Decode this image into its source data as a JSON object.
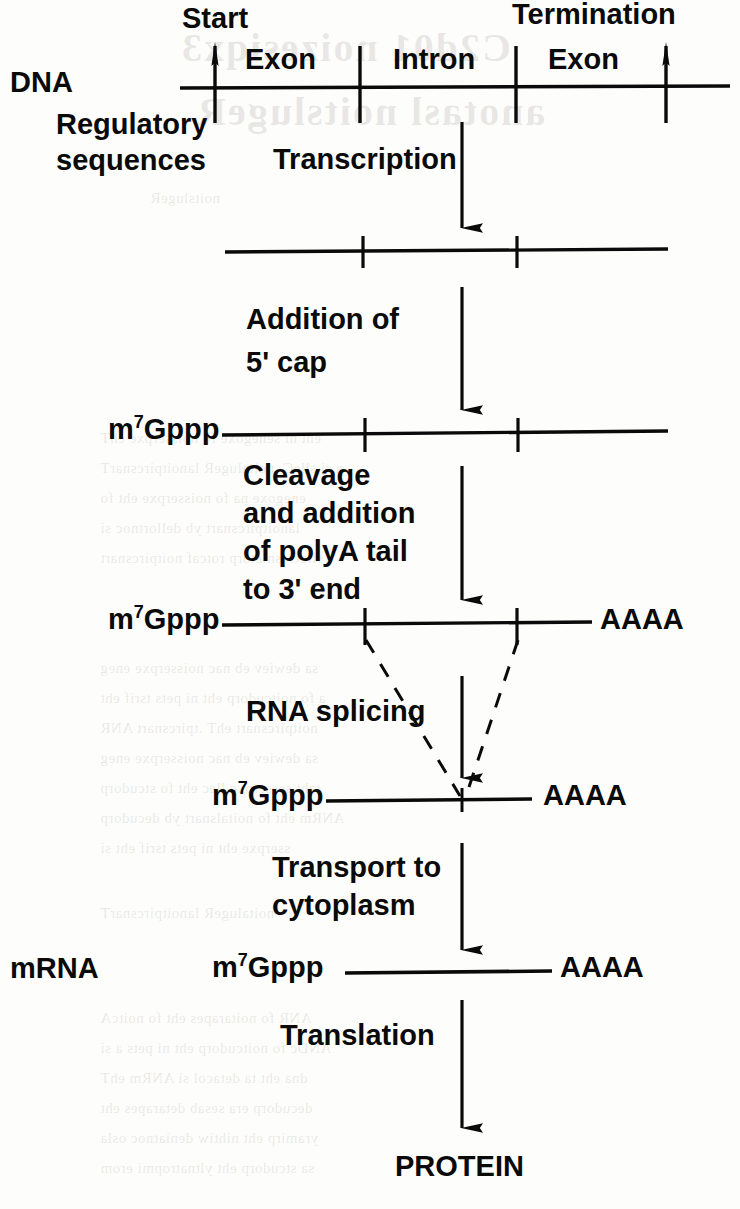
{
  "diagram": {
    "ink_color": "#0a0a0a",
    "background_color": "#fdfdfb",
    "row_labels": {
      "dna": "DNA",
      "regulatory_line1": "Regulatory",
      "regulatory_line2": "sequences",
      "mrna": "mRNA"
    },
    "gene_map": {
      "start_label": "Start",
      "termination_label": "Termination",
      "segments": [
        "Exon",
        "Intron",
        "Exon"
      ]
    },
    "steps": [
      {
        "id": "transcription",
        "lines": [
          "Transcription"
        ]
      },
      {
        "id": "capping",
        "lines": [
          "Addition of",
          "5' cap"
        ]
      },
      {
        "id": "cleavage-polya",
        "lines": [
          "Cleavage",
          "and addition",
          "of polyA tail",
          "to 3' end"
        ]
      },
      {
        "id": "splicing",
        "lines": [
          "RNA splicing"
        ]
      },
      {
        "id": "transport",
        "lines": [
          "Transport to",
          "cytoplasm"
        ]
      },
      {
        "id": "translation",
        "lines": [
          "Translation"
        ]
      }
    ],
    "cap_label": "m7Gppp",
    "cap_label_base": "m",
    "cap_label_sup": "7",
    "cap_label_rest": "Gppp",
    "polya_label": "AAAA",
    "product_label": "PROTEIN"
  },
  "ghost_text": {
    "title_line1": "C2d01 noizesiqx3",
    "title_line2": "anotasl noitslugeR",
    "lines": [
      "noitslugeR",
      "eht ni senegoxe fo noisserpxe ehT",
      "a si slleC .noitalugeR lanoitpircsnarT",
      "enegoxe na fo noisserpxe eht fo",
      "lanoitpircsnart yb dellortnoc si",
      "slleC .snietorp rotcaf noitpircsnart",
      "sa dewiev eb nac noisserpxe eneg",
      "a fo noitcudorp eht ni pets tsrif eht",
      "noitpircsnart ehT .tpircsnart ANR",
      "sa dewiev eb nac noisserpxe eneg",
      "taht sesserpxe llec eht fo stcudorp",
      "ANRm eht fo noitalsnart yb decudorp",
      "sserpxe eht ni pets tsrif eht si",
      "noitalugeR lanoitpircsnarT",
      "ANR fo noitarapes eht fo noitcA",
      "ANDc fo noitcudorp eht ni pets a si",
      "dna eht ta detacol si ANRm ehT",
      "decudorp era sesab detarapes eht",
      "yramirp eht nihtiw deniatnoc osla",
      "sa stcudorp eht yltnatropmi erom"
    ]
  },
  "layout": {
    "dna_line": {
      "x1": 180,
      "x2": 730,
      "y": 88,
      "ticks": [
        215,
        360,
        516,
        666
      ]
    },
    "transcript_line": {
      "x1": 225,
      "x2": 668,
      "y": 251,
      "ticks": [
        363,
        517
      ]
    },
    "capped_line": {
      "x1": 222,
      "x2": 668,
      "y": 434,
      "ticks": [
        365,
        518
      ]
    },
    "polya_line": {
      "x1": 222,
      "x2": 592,
      "y": 624,
      "ticks": [
        365,
        517
      ]
    },
    "spliced_line": {
      "x1": 326,
      "x2": 532,
      "y": 800,
      "ticks": [
        462
      ]
    },
    "mrna_line": {
      "x1": 345,
      "x2": 552,
      "y": 972,
      "ticks": []
    },
    "arrow_x": 462
  }
}
